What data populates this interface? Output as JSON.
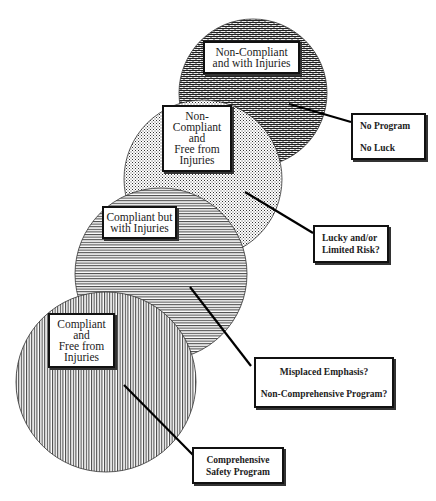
{
  "diagram": {
    "type": "overlapping-circles",
    "circles": [
      {
        "id": "non-compliant-with-injuries",
        "pattern": "brick",
        "label_lines": [
          "Non-Compliant",
          "and with Injuries"
        ],
        "callout_lines": [
          "No Program",
          "No Luck"
        ]
      },
      {
        "id": "non-compliant-free-from-injuries",
        "pattern": "dots",
        "label_lines": [
          "Non-",
          "Compliant",
          "and",
          "Free from",
          "Injuries"
        ],
        "callout_lines": [
          "Lucky and/or",
          "Limited Risk?"
        ]
      },
      {
        "id": "compliant-with-injuries",
        "pattern": "horizontal-lines",
        "label_lines": [
          "Compliant but",
          "with Injuries"
        ],
        "callout_lines": [
          "Misplaced Emphasis?",
          "Non-Comprehensive Program?"
        ]
      },
      {
        "id": "compliant-free-from-injuries",
        "pattern": "vertical-lines",
        "label_lines": [
          "Compliant",
          "and",
          "Free from",
          "Injuries"
        ],
        "callout_lines": [
          "Comprehensive",
          "Safety Program"
        ]
      }
    ],
    "colors": {
      "ink": "#111111",
      "background": "#ffffff",
      "fill_light": "#ffffff"
    }
  }
}
